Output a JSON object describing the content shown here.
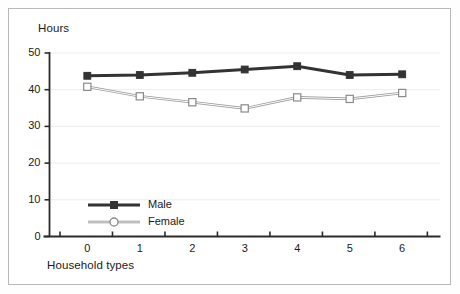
{
  "chart_data": {
    "type": "line",
    "title": "",
    "ylabel": "Hours",
    "xlabel": "Household types",
    "categories": [
      "0",
      "1",
      "2",
      "3",
      "4",
      "5",
      "6"
    ],
    "x": [
      0,
      1,
      2,
      3,
      4,
      5,
      6
    ],
    "series": [
      {
        "name": "Male",
        "values": [
          43.8,
          44.0,
          44.6,
          45.5,
          46.4,
          44.0,
          44.2
        ],
        "color": "#333333",
        "marker": "filled-square",
        "line_width": 3
      },
      {
        "name": "Female",
        "values": [
          40.8,
          38.2,
          36.6,
          34.9,
          37.9,
          37.5,
          39.1
        ],
        "color": "#808080",
        "marker": "open-square",
        "line_width": 1
      }
    ],
    "ylim": [
      0,
      50
    ],
    "yticks": [
      0,
      10,
      20,
      30,
      40,
      50
    ],
    "ytick_labels": [
      "0",
      "10",
      "20",
      "30",
      "40",
      "50"
    ],
    "xlim": [
      -0.5,
      6.5
    ],
    "xtick_labels": [
      "0",
      "1",
      "2",
      "3",
      "4",
      "5",
      "6"
    ],
    "grid": true,
    "grid_axis": "y",
    "legend_position": "inside-bottom-left",
    "legend": [
      {
        "label": "Male",
        "marker": "filled-square",
        "color": "#333333"
      },
      {
        "label": "Female",
        "marker": "open-circle",
        "color": "#8a8a8a"
      }
    ]
  },
  "frame": {
    "border_color": "#b8b8b8",
    "background": "#ffffff"
  }
}
